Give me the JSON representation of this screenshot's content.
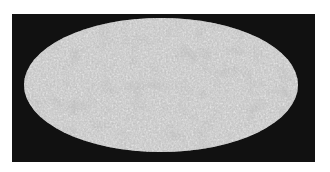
{
  "figure": {
    "projection": "mollweide",
    "colors": {
      "background": "#ffffff",
      "frame": "#111111",
      "map_base": "#bdbdbd",
      "map_dark_spot": "#8a8a8a",
      "map_light_spot": "#dcdcdc"
    }
  }
}
